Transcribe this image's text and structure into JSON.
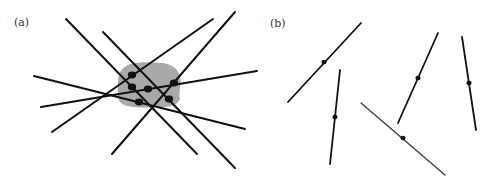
{
  "figure": {
    "colors": {
      "line": "#111111",
      "line_thin": "#3a3a3a",
      "blob": "#a9a9a9",
      "dot": "#111111",
      "background": "#ffffff"
    },
    "panels": [
      {
        "id": "a",
        "label": "(a)",
        "label_pos": [
          14,
          26
        ],
        "blob": {
          "path": "M126,66 C134,61 150,62 162,63 C172,64 178,69 180,76 C182,84 178,92 180,99 C178,105 168,108 155,107 C142,108 130,108 122,104 C116,99 118,90 118,83 C118,75 120,70 126,66 Z"
        },
        "lines": [
          {
            "x1": 66,
            "y1": 19,
            "x2": 197,
            "y2": 154
          },
          {
            "x1": 103,
            "y1": 32,
            "x2": 235,
            "y2": 168
          },
          {
            "x1": 213,
            "y1": 19,
            "x2": 52,
            "y2": 132
          },
          {
            "x1": 235,
            "y1": 12,
            "x2": 112,
            "y2": 154
          },
          {
            "x1": 34,
            "y1": 76,
            "x2": 245,
            "y2": 129
          },
          {
            "x1": 41,
            "y1": 107,
            "x2": 257,
            "y2": 71
          }
        ],
        "dots": [
          {
            "cx": 132,
            "cy": 75
          },
          {
            "cx": 132,
            "cy": 87
          },
          {
            "cx": 148,
            "cy": 89
          },
          {
            "cx": 174,
            "cy": 83
          },
          {
            "cx": 169,
            "cy": 99
          },
          {
            "cx": 139,
            "cy": 102
          }
        ]
      },
      {
        "id": "b",
        "label": "(b)",
        "label_pos": [
          270,
          27
        ],
        "segments": [
          {
            "x1": 288,
            "y1": 102,
            "x2": 361,
            "y2": 23,
            "dot": [
              324,
              62
            ],
            "thin": false
          },
          {
            "x1": 340,
            "y1": 70,
            "x2": 330,
            "y2": 164,
            "dot": [
              335,
              117
            ],
            "thin": false
          },
          {
            "x1": 438,
            "y1": 33,
            "x2": 398,
            "y2": 123,
            "dot": [
              418,
              78
            ],
            "thin": false
          },
          {
            "x1": 462,
            "y1": 37,
            "x2": 476,
            "y2": 130,
            "dot": [
              469,
              83
            ],
            "thin": false
          },
          {
            "x1": 361,
            "y1": 103,
            "x2": 445,
            "y2": 175,
            "dot": [
              403,
              138
            ],
            "thin": true
          }
        ]
      }
    ]
  }
}
